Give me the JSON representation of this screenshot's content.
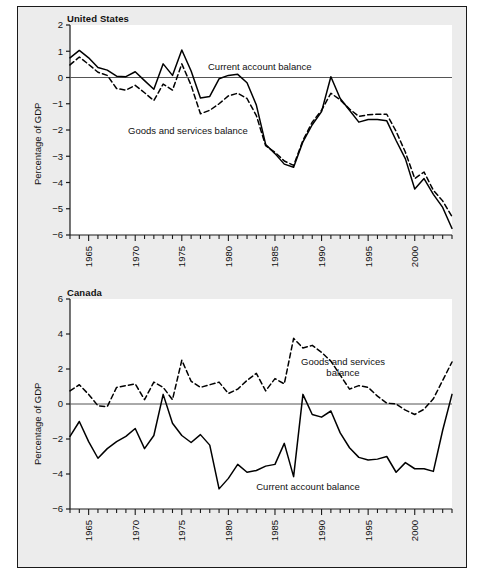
{
  "figure": {
    "background": "#ececec",
    "plot_background": "#ffffff",
    "border_color": "#1a1a1a",
    "line_color": "#000000"
  },
  "panels": {
    "us": {
      "title": "United States",
      "ylabel": "Percentage of GDP",
      "yticks": [
        "2",
        "1",
        "0",
        "-1",
        "-2",
        "-3",
        "-4",
        "-5",
        "-6"
      ],
      "xticks": [
        "1965",
        "1970",
        "1975",
        "1980",
        "1985",
        "1990",
        "1995",
        "2000"
      ],
      "annotations": [
        {
          "text": "Current account balance",
          "name": "annotation-current-account-balance"
        },
        {
          "text": "Goods and services balance",
          "name": "annotation-goods-services-balance"
        }
      ]
    },
    "canada": {
      "title": "Canada",
      "ylabel": "Percentage of GDP",
      "yticks": [
        "6",
        "4",
        "2",
        "0",
        "-2",
        "-4",
        "-6"
      ],
      "xticks": [
        "1965",
        "1970",
        "1975",
        "1980",
        "1985",
        "1990",
        "1995",
        "2000"
      ],
      "annotations": [
        {
          "text": "Goods and services",
          "text2": "balance",
          "name": "annotation-goods-services-balance"
        },
        {
          "text": "Current account balance",
          "name": "annotation-current-account-balance"
        }
      ]
    }
  },
  "chart_data": [
    {
      "type": "line",
      "title": "United States",
      "xlabel": "",
      "ylabel": "Percentage of GDP",
      "xlim": [
        1963,
        2004
      ],
      "ylim": [
        -6,
        2
      ],
      "yticks": [
        2,
        1,
        0,
        -1,
        -2,
        -3,
        -4,
        -5,
        -6
      ],
      "xticks": [
        1965,
        1970,
        1975,
        1980,
        1985,
        1990,
        1995,
        2000
      ],
      "grid": false,
      "legend": "inline-annotations",
      "zero_line": true,
      "x": [
        1963,
        1964,
        1965,
        1966,
        1967,
        1968,
        1969,
        1970,
        1971,
        1972,
        1973,
        1974,
        1975,
        1976,
        1977,
        1978,
        1979,
        1980,
        1981,
        1982,
        1983,
        1984,
        1985,
        1986,
        1987,
        1988,
        1989,
        1990,
        1991,
        1992,
        1993,
        1994,
        1995,
        1996,
        1997,
        1998,
        1999,
        2000,
        2001,
        2002,
        2003,
        2004
      ],
      "series": [
        {
          "name": "Current account balance",
          "style": "solid",
          "values": [
            0.75,
            1.03,
            0.75,
            0.38,
            0.28,
            0.05,
            0.03,
            0.22,
            -0.12,
            -0.45,
            0.52,
            0.08,
            1.05,
            0.25,
            -0.78,
            -0.72,
            -0.05,
            0.08,
            0.12,
            -0.2,
            -1.05,
            -2.55,
            -2.9,
            -3.3,
            -3.42,
            -2.45,
            -1.8,
            -1.3,
            0.03,
            -0.8,
            -1.25,
            -1.7,
            -1.6,
            -1.6,
            -1.65,
            -2.4,
            -3.1,
            -4.25,
            -3.85,
            -4.45,
            -4.95,
            -5.75
          ]
        },
        {
          "name": "Goods and services balance",
          "style": "dashed",
          "values": [
            0.48,
            0.78,
            0.5,
            0.2,
            0.08,
            -0.42,
            -0.48,
            -0.3,
            -0.58,
            -0.88,
            -0.25,
            -0.48,
            0.52,
            -0.3,
            -1.38,
            -1.25,
            -1.0,
            -0.7,
            -0.6,
            -0.8,
            -1.45,
            -2.6,
            -2.85,
            -3.18,
            -3.35,
            -2.4,
            -1.7,
            -1.25,
            -0.6,
            -0.85,
            -1.2,
            -1.48,
            -1.42,
            -1.4,
            -1.4,
            -2.05,
            -2.85,
            -3.85,
            -3.6,
            -4.3,
            -4.7,
            -5.3
          ]
        }
      ]
    },
    {
      "type": "line",
      "title": "Canada",
      "xlabel": "",
      "ylabel": "Percentage of GDP",
      "xlim": [
        1963,
        2004
      ],
      "ylim": [
        -6,
        6
      ],
      "yticks": [
        6,
        4,
        2,
        0,
        -2,
        -4,
        -6
      ],
      "xticks": [
        1965,
        1970,
        1975,
        1980,
        1985,
        1990,
        1995,
        2000
      ],
      "grid": false,
      "legend": "inline-annotations",
      "zero_line": true,
      "x": [
        1963,
        1964,
        1965,
        1966,
        1967,
        1968,
        1969,
        1970,
        1971,
        1972,
        1973,
        1974,
        1975,
        1976,
        1977,
        1978,
        1979,
        1980,
        1981,
        1982,
        1983,
        1984,
        1985,
        1986,
        1987,
        1988,
        1989,
        1990,
        1991,
        1992,
        1993,
        1994,
        1995,
        1996,
        1997,
        1998,
        1999,
        2000,
        2001,
        2002,
        2003,
        2004
      ],
      "series": [
        {
          "name": "Goods and services balance",
          "style": "dashed",
          "values": [
            0.75,
            1.1,
            0.55,
            -0.1,
            -0.15,
            0.95,
            1.05,
            1.15,
            0.25,
            1.25,
            0.95,
            0.25,
            2.5,
            1.3,
            0.95,
            1.1,
            1.25,
            0.6,
            0.85,
            1.35,
            1.75,
            0.75,
            1.45,
            1.15,
            3.75,
            3.2,
            3.35,
            2.95,
            2.45,
            1.65,
            0.85,
            1.05,
            0.95,
            0.45,
            0.05,
            0.0,
            -0.35,
            -0.6,
            -0.3,
            0.3,
            1.35,
            2.4
          ]
        },
        {
          "name": "Current account balance",
          "style": "solid",
          "values": [
            -1.85,
            -1.0,
            -2.15,
            -3.1,
            -2.55,
            -2.15,
            -1.85,
            -1.4,
            -2.55,
            -1.8,
            0.55,
            -1.1,
            -1.8,
            -2.2,
            -1.75,
            -2.35,
            -4.85,
            -4.25,
            -3.45,
            -3.9,
            -3.8,
            -3.55,
            -3.45,
            -2.25,
            -4.15,
            0.55,
            -0.6,
            -0.75,
            -0.4,
            -1.65,
            -2.5,
            -3.05,
            -3.2,
            -3.15,
            -3.0,
            -3.9,
            -3.35,
            -3.7,
            -3.7,
            -3.85,
            -1.5,
            0.55
          ]
        }
      ]
    }
  ]
}
